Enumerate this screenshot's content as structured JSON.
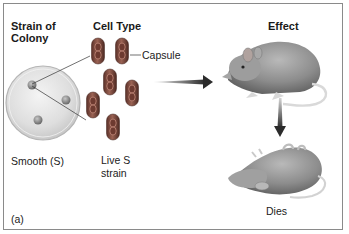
{
  "diagram": {
    "panel_label": "(a)",
    "headers": {
      "strain": "Strain of\nColony",
      "strain_line1": "Strain of",
      "strain_line2": "Colony",
      "cell_type": "Cell Type",
      "effect": "Effect"
    },
    "labels": {
      "capsule": "Capsule",
      "strain_name": "Smooth (S)",
      "cell_line1": "Live S",
      "cell_line2": "strain",
      "outcome": "Dies"
    },
    "elements": [
      {
        "id": "petri-dish",
        "type": "image",
        "description": "petri dish with 3 colonies"
      },
      {
        "id": "bacteria-cluster",
        "type": "image",
        "description": "7 encapsulated S-strain bacteria"
      },
      {
        "id": "arrow-right",
        "type": "arrow",
        "from": "bacteria-cluster",
        "to": "live-mouse"
      },
      {
        "id": "live-mouse",
        "type": "image",
        "description": "healthy mouse"
      },
      {
        "id": "arrow-down",
        "type": "arrow",
        "from": "live-mouse",
        "to": "dead-mouse"
      },
      {
        "id": "dead-mouse",
        "type": "image",
        "description": "dead mouse on its back"
      }
    ],
    "colors": {
      "cell_fill": "#7d4a3e",
      "cell_highlight": "#b07a6a",
      "dish_fill": "#e6e6e6",
      "arrow": "#2b2b2b",
      "mouse": "#8f8f8f"
    }
  }
}
